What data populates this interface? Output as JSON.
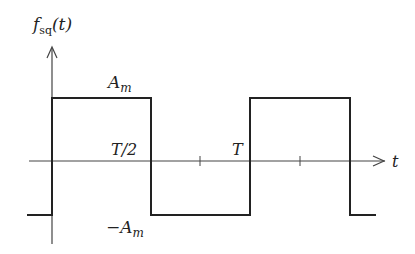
{
  "diagram": {
    "type": "square-wave",
    "y_axis_label": "f",
    "y_axis_label_sub": "sq",
    "y_axis_label_arg": "(t)",
    "x_axis_label": "t",
    "amplitude_pos_label": "A",
    "amplitude_neg_label": "−A",
    "amplitude_sub": "m",
    "half_period_label": "T/2",
    "period_label": "T",
    "colors": {
      "stroke": "#222222",
      "axis": "#444444",
      "background": "#ffffff"
    }
  }
}
